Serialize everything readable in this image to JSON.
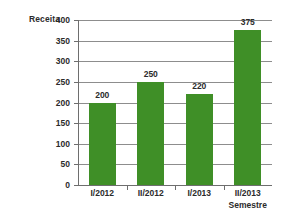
{
  "chart_data": {
    "type": "bar",
    "title": "",
    "categories": [
      "I/2012",
      "II/2012",
      "I/2013",
      "II/2013"
    ],
    "values": [
      200,
      250,
      220,
      375
    ],
    "data_labels": [
      "200",
      "250",
      "220",
      "375"
    ],
    "xlabel": "Semestre",
    "ylabel": "Receita",
    "ylim": [
      0,
      400
    ],
    "ytick_labels": [
      "0",
      "50",
      "100",
      "150",
      "200",
      "250",
      "300",
      "350",
      "400"
    ],
    "ytick_values": [
      0,
      50,
      100,
      150,
      200,
      250,
      300,
      350,
      400
    ],
    "grid": "horizontal",
    "legend": "none",
    "series": [
      {
        "name": "Receita",
        "values": [
          200,
          250,
          220,
          375
        ],
        "color": "#3f8f27"
      }
    ],
    "colors": {
      "bar": "#3f8f27",
      "grid": "#8d8d8d",
      "axis": "#6e6e6e",
      "text": "#2b2b2b",
      "background": "#ffffff"
    }
  }
}
